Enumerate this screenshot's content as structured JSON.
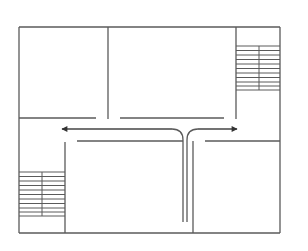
{
  "diagram": {
    "type": "floor-plan",
    "stroke_color": "#555555",
    "arrow_color": "#333333",
    "background": "#ffffff",
    "elements": {
      "rooms": [
        "top-left-room",
        "top-middle-room",
        "right-stairwell",
        "left-stairwell",
        "bottom-middle-room",
        "bottom-right-room"
      ],
      "corridor": "horizontal-corridor",
      "flow_arrows": [
        "arrow-left",
        "arrow-right"
      ],
      "staircases": [
        {
          "name": "top-right-staircase",
          "treads": 10
        },
        {
          "name": "bottom-left-staircase",
          "treads": 10
        }
      ]
    }
  }
}
